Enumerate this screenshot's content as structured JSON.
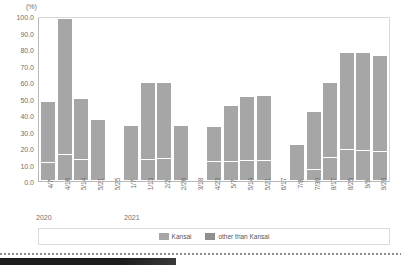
{
  "chart_data": {
    "type": "bar",
    "stacked": true,
    "title": "",
    "subtitle": "",
    "xlabel": "",
    "ylabel": "(%)",
    "unit_label": "(%)",
    "ylim": [
      0.0,
      100.0
    ],
    "ytick_labels": [
      "0.0",
      "10.0",
      "20.0",
      "30.0",
      "40.0",
      "50.0",
      "60.0",
      "70.0",
      "80.0",
      "90.0",
      "100.0"
    ],
    "ytick_values": [
      0.0,
      10.0,
      20.0,
      30.0,
      40.0,
      50.0,
      60.0,
      70.0,
      80.0,
      90.0,
      100.0
    ],
    "grid": false,
    "legend_position": "bottom",
    "categories": [
      "4/7",
      "4/16",
      "5/14",
      "5/21",
      "5/25",
      "1/7",
      "1/13",
      "2/2",
      "2/26",
      "3/18",
      "4/23",
      "5/7",
      "5/14",
      "5/21",
      "6/17",
      "7/8",
      "7/30",
      "8/17",
      "8/25",
      "9/9",
      "9/28"
    ],
    "group_labels": [
      {
        "label": "2020",
        "start_index": 0,
        "end_index": 4
      },
      {
        "label": "2021",
        "start_index": 5,
        "end_index": 20
      }
    ],
    "series": [
      {
        "name": "Kansai",
        "color": "#a6a6a6",
        "values": [
          11.0,
          16.0,
          13.0,
          0.0,
          null,
          0.0,
          13.0,
          13.5,
          0.0,
          null,
          12.0,
          12.0,
          12.5,
          12.5,
          null,
          0.0,
          7.0,
          14.0,
          19.0,
          18.5,
          18.0
        ]
      },
      {
        "name": "other than Kansai",
        "color": "#a6a6a6",
        "values": [
          37.5,
          84.0,
          37.5,
          37.0,
          null,
          33.5,
          47.5,
          47.0,
          33.5,
          null,
          21.0,
          34.0,
          39.0,
          39.5,
          null,
          21.5,
          35.0,
          46.5,
          60.0,
          60.5,
          59.0
        ]
      }
    ],
    "totals": [
      48.5,
      100.0,
      50.5,
      37.0,
      null,
      33.5,
      60.5,
      60.5,
      33.5,
      null,
      33.0,
      46.0,
      51.5,
      52.0,
      null,
      21.5,
      42.0,
      60.5,
      79.0,
      79.0,
      77.0
    ]
  },
  "legend": {
    "items": [
      {
        "label": "Kansai",
        "color": "#a6a6a6"
      },
      {
        "label": "other than Kansai",
        "color": "#8f8f8f"
      }
    ]
  }
}
